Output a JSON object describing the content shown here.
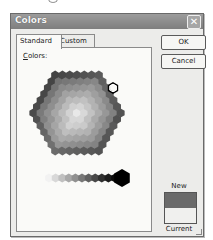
{
  "dialog": {
    "title": "Colors",
    "close_icon": "close-icon"
  },
  "tabs": [
    {
      "label": "Standard",
      "active": true
    },
    {
      "label": "Custom",
      "active": false
    }
  ],
  "panel": {
    "colors_label_prefix": "C",
    "colors_label_rest": "olors:"
  },
  "buttons": {
    "ok": "OK",
    "cancel": "Cancel"
  },
  "preview": {
    "new_label": "New",
    "current_label": "Current",
    "new_color": "#6a6a6a",
    "current_color": "#f0f0ee"
  },
  "palette": {
    "selected_index_note": "selected hexagon near upper-right edge",
    "grays": [
      "#f2f2f2",
      "#d8d8d8",
      "#c0c0c0",
      "#a8a8a8",
      "#909090",
      "#787878",
      "#606060",
      "#484848",
      "#303030",
      "#1c1c1c",
      "#0c0c0c"
    ],
    "black": "#000000"
  }
}
